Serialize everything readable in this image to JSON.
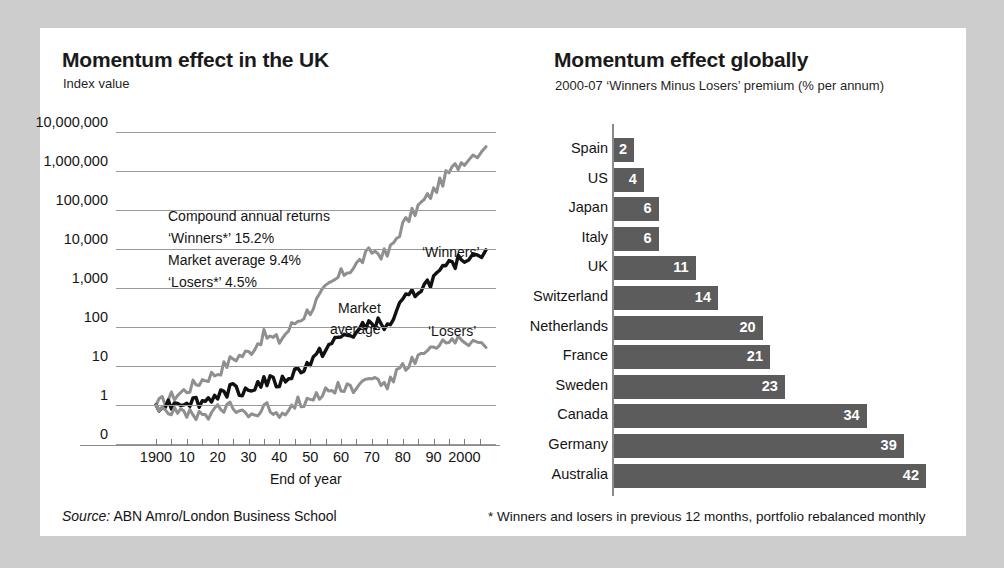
{
  "left_chart": {
    "title": "Momentum effect in the UK",
    "axis_label": "Index value",
    "x_axis_title": "End of year",
    "annotations": {
      "heading": "Compound annual returns",
      "winners": "‘Winners*’ 15.2%",
      "market": "Market average 9.4%",
      "losers": "‘Losers*’ 4.5%"
    },
    "series_labels": {
      "winners": "‘Winners’",
      "market_line1": "Market",
      "market_line2": "average",
      "losers": "‘Losers’"
    },
    "chart_data": {
      "type": "line",
      "title": "Momentum effect in the UK",
      "xlabel": "End of year",
      "ylabel": "Index value",
      "yscale": "log",
      "ytick_labels": [
        "10,000,000",
        "1,000,000",
        "100,000",
        "10,000",
        "1,000",
        "100",
        "10",
        "1",
        "0"
      ],
      "ylim": [
        0,
        10000000
      ],
      "grid": true,
      "xtick_labels": [
        "1900",
        "10",
        "20",
        "30",
        "40",
        "50",
        "60",
        "70",
        "80",
        "90",
        "2000"
      ],
      "x": [
        1900,
        1905,
        1910,
        1915,
        1920,
        1925,
        1930,
        1935,
        1940,
        1945,
        1950,
        1955,
        1960,
        1965,
        1970,
        1975,
        1980,
        1985,
        1990,
        1995,
        2000,
        2007
      ],
      "series": [
        {
          "name": "‘Winners’",
          "color": "#8f8f8f",
          "cagr": "15.2%",
          "values": [
            1,
            1.6,
            2.5,
            4.5,
            7,
            16,
            22,
            60,
            45,
            130,
            280,
            900,
            2200,
            4000,
            9000,
            7000,
            40000,
            120000,
            300000,
            900000,
            2000000,
            4200000
          ]
        },
        {
          "name": "Market average",
          "color": "#111111",
          "cagr": "9.4%",
          "values": [
            1,
            1.1,
            1.3,
            1.2,
            1.9,
            2.6,
            2.4,
            4.2,
            3.6,
            7,
            12,
            28,
            55,
            70,
            140,
            95,
            420,
            900,
            1700,
            3500,
            6000,
            9500
          ]
        },
        {
          "name": "‘Losers’",
          "color": "#8f8f8f",
          "cagr": "4.5%",
          "values": [
            1,
            0.7,
            0.55,
            0.5,
            0.75,
            0.85,
            0.55,
            0.9,
            0.6,
            1.1,
            1.4,
            2.2,
            3.2,
            2.6,
            5.5,
            3.2,
            9,
            16,
            26,
            40,
            48,
            30
          ]
        }
      ]
    }
  },
  "right_chart": {
    "title": "Momentum effect globally",
    "subtitle": "2000-07 ‘Winners Minus Losers’ premium (% per annum)",
    "chart_data": {
      "type": "bar",
      "orientation": "horizontal",
      "title": "Momentum effect globally",
      "subtitle": "2000-07 ‘Winners Minus Losers’ premium (% per annum)",
      "xlabel": "% per annum",
      "ylabel": "",
      "bar_color": "#5c5c5c",
      "value_label_color": "#ffffff",
      "xlim": [
        0,
        42
      ],
      "grid": false,
      "categories": [
        "Spain",
        "US",
        "Japan",
        "Italy",
        "UK",
        "Switzerland",
        "Netherlands",
        "France",
        "Sweden",
        "Canada",
        "Germany",
        "Australia"
      ],
      "values": [
        2,
        4,
        6,
        6,
        11,
        14,
        20,
        21,
        23,
        34,
        39,
        42
      ]
    }
  },
  "footer": {
    "source_label": "Source:",
    "source_text": "ABN Amro/London Business School",
    "note": "* Winners and losers in previous 12 months, portfolio rebalanced monthly"
  }
}
